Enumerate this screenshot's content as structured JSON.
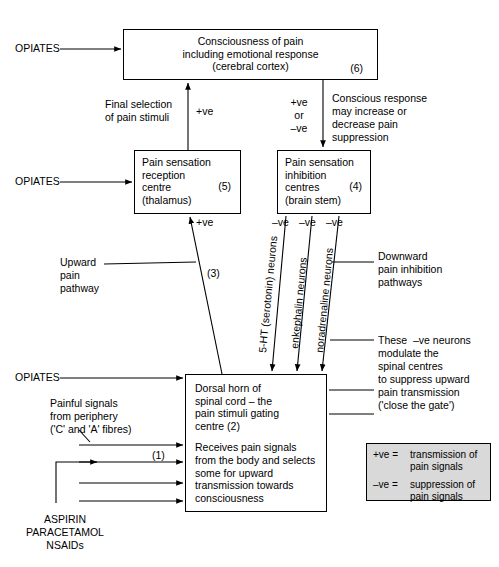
{
  "diagram": {
    "boxes": {
      "consciousness": {
        "line1": "Consciousness of pain",
        "line2": "including emotional response",
        "line3": "(cerebral cortex)",
        "number": "(6)"
      },
      "reception": {
        "line1": "Pain sensation",
        "line2": "reception",
        "line3": "centre",
        "line4": "(thalamus)",
        "number": "(5)"
      },
      "inhibition": {
        "line1": "Pain sensation",
        "line2": "inhibition",
        "line3": "centres",
        "line4": "(brain stem)",
        "number": "(4)"
      },
      "dorsal_horn": {
        "p1_line1": "Dorsal horn of",
        "p1_line2": "spinal cord – the",
        "p1_line3": "pain stimuli gating",
        "p1_line4": "centre (2)",
        "p2_line1": "Receives pain signals",
        "p2_line2": "from the body and selects",
        "p2_line3": "some for upward",
        "p2_line4": "transmission towards",
        "p2_line5": "consciousness"
      }
    },
    "drug_labels": {
      "opiates_top": "OPIATES",
      "opiates_mid": "OPIATES",
      "opiates_bottom": "OPIATES",
      "nsaids_line1": "ASPIRIN",
      "nsaids_line2": "PARACETAMOL",
      "nsaids_line3": "NSAIDs"
    },
    "annotations": {
      "final_selection_line1": "Final selection",
      "final_selection_line2": "of pain stimuli",
      "plus_ve_top": "+ve",
      "conscious_response_line1": "Conscious response",
      "conscious_response_line2": "may increase or",
      "conscious_response_line3": "decrease pain",
      "conscious_response_line4": "suppression",
      "sign_plus": "+ve",
      "sign_or": "or",
      "sign_minus": "–ve",
      "plus_ve_box5": "+ve",
      "minus_ve_1": "–ve",
      "minus_ve_2": "–ve",
      "minus_ve_3": "–ve",
      "upward_line1": "Upward",
      "upward_line2": "pain",
      "upward_line3": "pathway",
      "pathway_number_3": "(3)",
      "pathway_number_1": "(1)",
      "downward_line1": "Downward",
      "downward_line2": "pain inhibition",
      "downward_line3": "pathways",
      "modulate_line1": "These  –ve neurons",
      "modulate_line2": "modulate the",
      "modulate_line3": "spinal centres",
      "modulate_line4": "to suppress upward",
      "modulate_line5": "pain transmission",
      "modulate_line6": "('close the gate')",
      "painful_line1": "Painful signals",
      "painful_line2": "from periphery",
      "painful_line3": "('C' and 'A' fibres)"
    },
    "neurons": {
      "serotonin": "5-HT (serotonin) neurons",
      "enkephalin": "enkephalin neurons",
      "noradrenaline": "noradrenaline neurons"
    },
    "legend": {
      "plus_symbol": "+ve  =",
      "plus_def_line1": "transmission of",
      "plus_def_line2": "pain signals",
      "minus_symbol": "–ve  =",
      "minus_def_line1": "suppression of",
      "minus_def_line2": "pain signals"
    },
    "colors": {
      "stroke": "#000000",
      "legend_fill": "#d9d9d9",
      "background": "#ffffff"
    }
  }
}
